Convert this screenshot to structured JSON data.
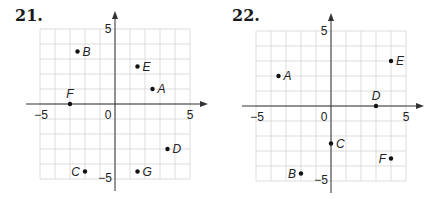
{
  "chart_data": [
    {
      "type": "scatter",
      "title": "21.",
      "xlabel": "",
      "ylabel": "",
      "xlim": [
        -5,
        5
      ],
      "ylim": [
        -5,
        5
      ],
      "grid": true,
      "tick_labels": {
        "x_min": "-5",
        "x_max": "5",
        "y_min": "-5",
        "y_max": "5",
        "origin": "0"
      },
      "points": [
        {
          "label": "A",
          "x": 2.5,
          "y": 1,
          "label_pos": "right"
        },
        {
          "label": "B",
          "x": -2.5,
          "y": 3.5,
          "label_pos": "right"
        },
        {
          "label": "C",
          "x": -2,
          "y": -4.5,
          "label_pos": "left"
        },
        {
          "label": "D",
          "x": 3.5,
          "y": -3,
          "label_pos": "right"
        },
        {
          "label": "E",
          "x": 1.5,
          "y": 2.5,
          "label_pos": "right"
        },
        {
          "label": "F",
          "x": -3,
          "y": 0,
          "label_pos": "above"
        },
        {
          "label": "G",
          "x": 1.5,
          "y": -4.5,
          "label_pos": "right"
        }
      ]
    },
    {
      "type": "scatter",
      "title": "22.",
      "xlabel": "",
      "ylabel": "",
      "xlim": [
        -5,
        5
      ],
      "ylim": [
        -5,
        5
      ],
      "grid": true,
      "tick_labels": {
        "x_min": "-5",
        "x_max": "5",
        "y_min": "-5",
        "y_max": "5",
        "origin": "0"
      },
      "points": [
        {
          "label": "A",
          "x": -3.5,
          "y": 2,
          "label_pos": "right"
        },
        {
          "label": "B",
          "x": -2,
          "y": -4.5,
          "label_pos": "left"
        },
        {
          "label": "C",
          "x": 0,
          "y": -2.5,
          "label_pos": "right"
        },
        {
          "label": "D",
          "x": 3,
          "y": 0,
          "label_pos": "above"
        },
        {
          "label": "E",
          "x": 4,
          "y": 3,
          "label_pos": "right"
        },
        {
          "label": "F",
          "x": 4,
          "y": -3.5,
          "label_pos": "left"
        }
      ]
    }
  ],
  "colors": {
    "grid": "#d4d4d4",
    "axis": "#333333",
    "point": "#111111",
    "text": "#222222"
  }
}
